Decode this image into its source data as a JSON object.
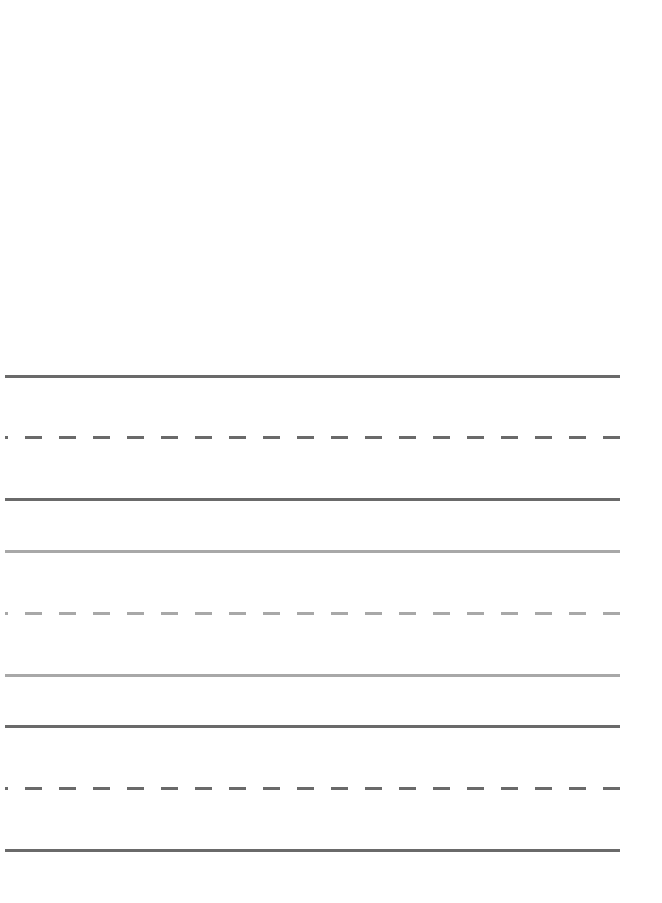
{
  "page": {
    "type": "handwriting-practice-sheet",
    "background": "#ffffff"
  },
  "ruling": {
    "left_x": 5,
    "right_x": 620,
    "groups": [
      {
        "color": "#6a6a6a",
        "lines": [
          {
            "style": "solid",
            "y": 375
          },
          {
            "style": "dashed",
            "y": 437
          },
          {
            "style": "solid",
            "y": 498
          }
        ]
      },
      {
        "color": "#a8a8a8",
        "lines": [
          {
            "style": "solid",
            "y": 550
          },
          {
            "style": "dashed",
            "y": 612
          },
          {
            "style": "solid",
            "y": 674
          }
        ]
      },
      {
        "color": "#6a6a6a",
        "lines": [
          {
            "style": "solid",
            "y": 725
          },
          {
            "style": "dashed",
            "y": 787
          },
          {
            "style": "solid",
            "y": 849
          }
        ]
      }
    ]
  }
}
